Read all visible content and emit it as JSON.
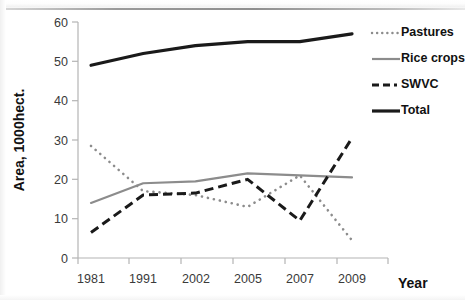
{
  "chart_data": {
    "type": "line",
    "title": "",
    "xlabel": "Year",
    "ylabel": "Area, 1000hect.",
    "categories": [
      "1981",
      "1991",
      "2002",
      "2005",
      "2007",
      "2009"
    ],
    "ylim": [
      0,
      60
    ],
    "yticks": [
      0,
      10,
      20,
      30,
      40,
      50,
      60
    ],
    "grid": false,
    "legend_position": "right",
    "series": [
      {
        "name": "Pastures",
        "style": "dotted",
        "color": "#8c8c8c",
        "values": [
          28.5,
          17,
          16,
          13,
          21,
          4.5
        ]
      },
      {
        "name": "Rice crops",
        "style": "solid",
        "color": "#8c8c8c",
        "values": [
          14,
          19,
          19.5,
          21.5,
          21,
          20.5
        ]
      },
      {
        "name": "SWVC",
        "style": "dashed",
        "color": "#1a1a1a",
        "values": [
          6.5,
          16,
          16.5,
          20,
          9.5,
          30.5
        ]
      },
      {
        "name": "Total",
        "style": "solid-thick",
        "color": "#1a1a1a",
        "values": [
          49,
          52,
          54,
          55,
          55,
          57
        ]
      }
    ]
  },
  "axes": {
    "y_label": "Area, 1000hect.",
    "x_label": "Year",
    "y_tick_labels": [
      "60",
      "50",
      "40",
      "30",
      "20",
      "10",
      "0"
    ],
    "x_tick_labels": [
      "1981",
      "1991",
      "2002",
      "2005",
      "2007",
      "2009"
    ]
  },
  "legend": {
    "entries": [
      {
        "label": "Pastures",
        "swatch": "dotted-line-icon"
      },
      {
        "label": "Rice crops",
        "swatch": "solid-gray-line-icon"
      },
      {
        "label": "SWVC",
        "swatch": "dashed-line-icon"
      },
      {
        "label": "Total",
        "swatch": "solid-black-line-icon"
      }
    ]
  },
  "colors": {
    "axis": "#b4b4b4",
    "tick_text": "#3a3a3a",
    "series_gray": "#8c8c8c",
    "series_black": "#1a1a1a",
    "background": "#ffffff"
  }
}
